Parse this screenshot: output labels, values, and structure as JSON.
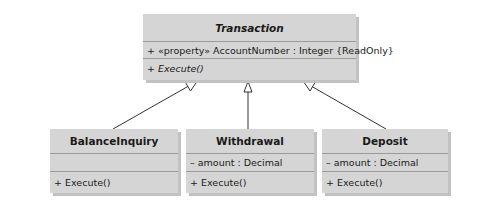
{
  "diagram": {
    "type": "UML class diagram",
    "colors": {
      "box_fill": "#d5d5d5",
      "box_shadow": "#c2c2c2",
      "separator": "#9a9a9a",
      "line": "#333333",
      "background": "#ffffff"
    },
    "superclass": {
      "name": "Transaction",
      "abstract": true,
      "attributes": [
        "+ «property» AccountNumber : Integer {ReadOnly}"
      ],
      "operations": [
        "+ Execute()"
      ],
      "operations_abstract": true
    },
    "subclasses": [
      {
        "name": "BalanceInquiry",
        "attributes": [
          ""
        ],
        "operations": [
          "+ Execute()"
        ]
      },
      {
        "name": "Withdrawal",
        "attributes": [
          "– amount : Decimal"
        ],
        "operations": [
          "+ Execute()"
        ]
      },
      {
        "name": "Deposit",
        "attributes": [
          "– amount : Decimal"
        ],
        "operations": [
          "+ Execute()"
        ]
      }
    ],
    "relationships": [
      {
        "from": "BalanceInquiry",
        "to": "Transaction",
        "kind": "generalization"
      },
      {
        "from": "Withdrawal",
        "to": "Transaction",
        "kind": "generalization"
      },
      {
        "from": "Deposit",
        "to": "Transaction",
        "kind": "generalization"
      }
    ]
  }
}
